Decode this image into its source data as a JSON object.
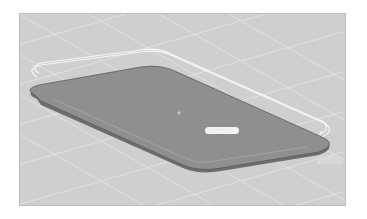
{
  "viewport": {
    "name": "3d-model-viewport",
    "background": "#cfcfcf",
    "grid_color": "#e4e4e4"
  },
  "model": {
    "plate_fill": "#8f8f8f",
    "plate_edge": "#6a6a6a",
    "outline_color": "#f5f5f5",
    "center_marker": "+"
  },
  "labels": {
    "dimension_pill": "· · · · · · ·",
    "corner_tag": "· · · · ·"
  }
}
